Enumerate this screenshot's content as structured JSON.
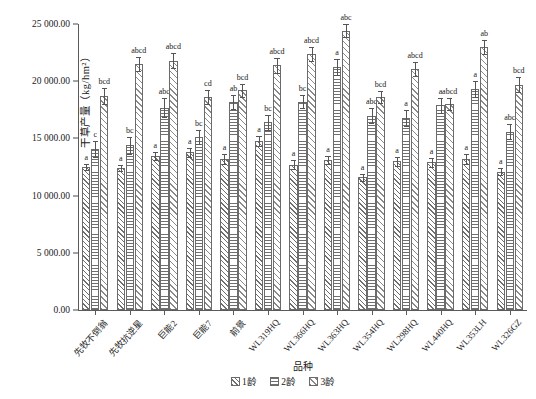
{
  "chart_data": {
    "type": "bar",
    "title": "",
    "xlabel": "品种",
    "ylabel": "干草产量（kg/hm²）",
    "ylim": [
      0,
      25000
    ],
    "yticks": [
      0,
      5000,
      10000,
      15000,
      20000,
      25000
    ],
    "ytick_labels": [
      "0.00",
      "5 000.00",
      "10 000.00",
      "15 000.00",
      "20 000.00",
      "25 000.00"
    ],
    "grid": false,
    "legend_position": "bottom",
    "categories": [
      "先牧不倒翁",
      "先牧抗逆星",
      "巨能2",
      "巨能7",
      "前景",
      "WL319HQ",
      "WL366HQ",
      "WL363HQ",
      "WL354HQ",
      "WL298HQ",
      "WL440HQ",
      "WL353LH",
      "WL326GZ"
    ],
    "series": [
      {
        "name": "1龄",
        "pattern": "diagonal-hatch",
        "values": [
          12500,
          12400,
          13500,
          13800,
          13200,
          14800,
          12700,
          13100,
          11600,
          13000,
          12900,
          13200,
          12100
        ],
        "errors": [
          300,
          280,
          350,
          400,
          420,
          430,
          380,
          360,
          330,
          390,
          370,
          410,
          340
        ],
        "letters": [
          "a",
          "a",
          "a",
          "a",
          "a",
          "a",
          "a",
          "a",
          "a",
          "a",
          "a",
          "a",
          "a"
        ]
      },
      {
        "name": "2龄",
        "pattern": "horizontal-lines",
        "values": [
          14100,
          14400,
          17700,
          15100,
          18200,
          16400,
          18200,
          21200,
          17000,
          16800,
          17900,
          19300,
          15600
        ],
        "errors": [
          700,
          750,
          800,
          600,
          620,
          680,
          560,
          700,
          650,
          720,
          640,
          700,
          690
        ],
        "letters": [
          "c",
          "bc",
          "abc",
          "bc",
          "ab",
          "bc",
          "bc",
          "a",
          "abc",
          "a",
          "a",
          "a",
          "abc"
        ]
      },
      {
        "name": "3龄",
        "pattern": "diagonal-hatch-wide",
        "values": [
          18700,
          21500,
          21800,
          18600,
          19200,
          21400,
          22400,
          24400,
          18600,
          21100,
          18000,
          23000,
          19700
        ],
        "errors": [
          700,
          600,
          650,
          620,
          560,
          640,
          600,
          580,
          520,
          610,
          560,
          600,
          640
        ],
        "letters": [
          "bcd",
          "abcd",
          "abcd",
          "cd",
          "bcd",
          "abcd",
          "abcd",
          "abc",
          "bcd",
          "abcd",
          "abcd",
          "ab",
          "bcd"
        ]
      }
    ],
    "legend": [
      {
        "label": "1龄",
        "pattern": "diagonal-hatch"
      },
      {
        "label": "2龄",
        "pattern": "horizontal-lines"
      },
      {
        "label": "3龄",
        "pattern": "diagonal-hatch-wide"
      }
    ]
  }
}
